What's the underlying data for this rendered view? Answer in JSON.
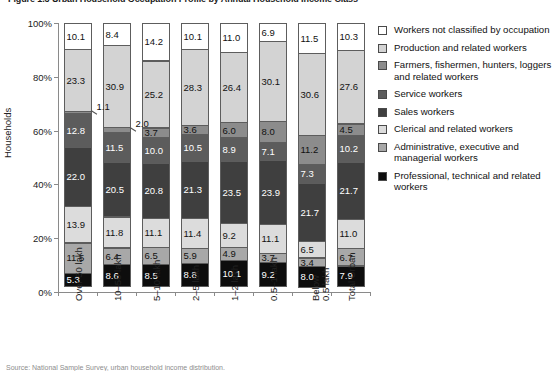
{
  "figure": {
    "title": "Figure 1.3 Urban Household Occupation Profile by Annual Household Income Class",
    "source_note": "Source: National Sample Survey, urban household income distribution."
  },
  "axes": {
    "y_title": "Households",
    "y_ticks": [
      "0%",
      "20%",
      "40%",
      "60%",
      "80%",
      "100%"
    ],
    "y_tick_values": [
      0,
      20,
      40,
      60,
      80,
      100
    ]
  },
  "colors": {
    "workers_not_classified": "#ffffff",
    "production_and_related": "#d3d3d3",
    "farmers_fishermen": "#8c8c8c",
    "service_workers": "#5c5c5c",
    "sales_workers": "#3f3f3f",
    "clerical_and_related": "#dcdcdc",
    "administrative_executive": "#a8a8a8",
    "professional_technical": "#0d0d0d",
    "axis": "#8a8a8a",
    "outline": "#5d5d5d"
  },
  "legend": {
    "items": [
      {
        "label": "Workers not classified by occupation",
        "color": "#ffffff",
        "key": "workers_not_classified"
      },
      {
        "label": "Production and related workers",
        "color": "#d3d3d3",
        "key": "production_and_related"
      },
      {
        "label": "Farmers, fishermen, hunters, loggers and related workers",
        "color": "#8c8c8c",
        "key": "farmers_fishermen"
      },
      {
        "label": "Service workers",
        "color": "#5c5c5c",
        "key": "service_workers"
      },
      {
        "label": "Sales workers",
        "color": "#3f3f3f",
        "key": "sales_workers"
      },
      {
        "label": "Clerical and related workers",
        "color": "#dcdcdc",
        "key": "clerical_and_related"
      },
      {
        "label": "Administrative, executive and managerial workers",
        "color": "#a8a8a8",
        "key": "administrative_executive"
      },
      {
        "label": "Professional, technical and related workers",
        "color": "#0d0d0d",
        "key": "professional_technical"
      }
    ]
  },
  "chart_data": {
    "type": "bar",
    "subtype": "stacked-percentage",
    "title": "Figure 1.3 Urban Household Occupation Profile by Annual Household Income Class",
    "xlabel": "",
    "ylabel": "Households",
    "ylim": [
      0,
      100
    ],
    "grid": false,
    "legend_position": "right",
    "categories": [
      "Over 50 lakh",
      "10–50 lakh",
      "5–10 lakh",
      "2–5 lakh",
      "1–2 lakh",
      "0.5–1 lakh",
      "Below 0.5 lakh",
      "Total Urban"
    ],
    "category_lines": [
      [
        "Over 50 lakh"
      ],
      [
        "10–50 lakh"
      ],
      [
        "5–10 lakh"
      ],
      [
        "2–5 lakh"
      ],
      [
        "1–2 lakh"
      ],
      [
        "0.5–1 lakh"
      ],
      [
        "Below",
        "0.5 lakh"
      ],
      [
        "Total Urban"
      ]
    ],
    "series": [
      {
        "name": "Professional, technical and related workers",
        "color": "#0d0d0d",
        "values": [
          5.3,
          8.6,
          8.5,
          8.8,
          10.1,
          9.2,
          8.0,
          7.9
        ]
      },
      {
        "name": "Administrative, executive and managerial workers",
        "color": "#a8a8a8",
        "values": [
          11.5,
          6.4,
          6.5,
          5.9,
          4.9,
          3.7,
          3.4,
          6.7
        ]
      },
      {
        "name": "Clerical and related workers",
        "color": "#dcdcdc",
        "values": [
          13.9,
          11.8,
          11.1,
          11.4,
          9.2,
          11.1,
          6.5,
          11.0
        ]
      },
      {
        "name": "Sales workers",
        "color": "#3f3f3f",
        "values": [
          22.0,
          20.5,
          20.8,
          21.3,
          23.5,
          23.9,
          21.7,
          21.7
        ]
      },
      {
        "name": "Service workers",
        "color": "#5c5c5c",
        "values": [
          12.8,
          11.5,
          10.0,
          10.5,
          8.9,
          7.1,
          7.3,
          10.2
        ]
      },
      {
        "name": "Farmers, fishermen, hunters, loggers and related workers",
        "color": "#8c8c8c",
        "values": [
          1.1,
          2.0,
          3.7,
          3.6,
          6.0,
          8.0,
          11.2,
          4.5
        ]
      },
      {
        "name": "Production and related workers",
        "color": "#d3d3d3",
        "values": [
          23.3,
          30.9,
          25.2,
          28.3,
          26.4,
          30.1,
          30.6,
          27.6
        ]
      },
      {
        "name": "Workers not classified by occupation",
        "color": "#ffffff",
        "values": [
          10.1,
          8.4,
          14.2,
          10.1,
          11.0,
          6.9,
          11.5,
          10.3
        ]
      }
    ],
    "bars": [
      {
        "category": "Over 50 lakh",
        "segments": [
          {
            "key": "workers_not_classified",
            "value": 10.1,
            "label": "10.1"
          },
          {
            "key": "production_and_related",
            "value": 23.3,
            "label": "23.3"
          },
          {
            "key": "farmers_fishermen",
            "value": 1.1,
            "label": "1.1",
            "callout": true
          },
          {
            "key": "service_workers",
            "value": 12.8,
            "label": "12.8"
          },
          {
            "key": "sales_workers",
            "value": 22.0,
            "label": "22.0"
          },
          {
            "key": "clerical_and_related",
            "value": 13.9,
            "label": "13.9"
          },
          {
            "key": "administrative_executive",
            "value": 11.5,
            "label": "11.5"
          },
          {
            "key": "professional_technical",
            "value": 5.3,
            "label": "5.3"
          }
        ]
      },
      {
        "category": "10–50 lakh",
        "segments": [
          {
            "key": "workers_not_classified",
            "value": 8.4,
            "label": "8.4"
          },
          {
            "key": "production_and_related",
            "value": 30.9,
            "label": "30.9"
          },
          {
            "key": "farmers_fishermen",
            "value": 2.0,
            "label": "2.0",
            "callout": true
          },
          {
            "key": "service_workers",
            "value": 11.5,
            "label": "11.5"
          },
          {
            "key": "sales_workers",
            "value": 20.5,
            "label": "20.5"
          },
          {
            "key": "clerical_and_related",
            "value": 11.8,
            "label": "11.8"
          },
          {
            "key": "administrative_executive",
            "value": 6.4,
            "label": "6.4"
          },
          {
            "key": "professional_technical",
            "value": 8.6,
            "label": "8.6"
          }
        ]
      },
      {
        "category": "5–10 lakh",
        "segments": [
          {
            "key": "workers_not_classified",
            "value": 14.2,
            "label": "14.2"
          },
          {
            "key": "production_and_related",
            "value": 25.2,
            "label": "25.2"
          },
          {
            "key": "farmers_fishermen",
            "value": 3.7,
            "label": "3.7"
          },
          {
            "key": "service_workers",
            "value": 10.0,
            "label": "10.0"
          },
          {
            "key": "sales_workers",
            "value": 20.8,
            "label": "20.8"
          },
          {
            "key": "clerical_and_related",
            "value": 11.1,
            "label": "11.1"
          },
          {
            "key": "administrative_executive",
            "value": 6.5,
            "label": "6.5"
          },
          {
            "key": "professional_technical",
            "value": 8.5,
            "label": "8.5"
          }
        ]
      },
      {
        "category": "2–5 lakh",
        "segments": [
          {
            "key": "workers_not_classified",
            "value": 10.1,
            "label": "10.1"
          },
          {
            "key": "production_and_related",
            "value": 28.3,
            "label": "28.3"
          },
          {
            "key": "farmers_fishermen",
            "value": 3.6,
            "label": "3.6"
          },
          {
            "key": "service_workers",
            "value": 10.5,
            "label": "10.5"
          },
          {
            "key": "sales_workers",
            "value": 21.3,
            "label": "21.3"
          },
          {
            "key": "clerical_and_related",
            "value": 11.4,
            "label": "11.4"
          },
          {
            "key": "administrative_executive",
            "value": 5.9,
            "label": "5.9"
          },
          {
            "key": "professional_technical",
            "value": 8.8,
            "label": "8.8"
          }
        ]
      },
      {
        "category": "1–2 lakh",
        "segments": [
          {
            "key": "workers_not_classified",
            "value": 11.0,
            "label": "11.0"
          },
          {
            "key": "production_and_related",
            "value": 26.4,
            "label": "26.4"
          },
          {
            "key": "farmers_fishermen",
            "value": 6.0,
            "label": "6.0"
          },
          {
            "key": "service_workers",
            "value": 8.9,
            "label": "8.9"
          },
          {
            "key": "sales_workers",
            "value": 23.5,
            "label": "23.5"
          },
          {
            "key": "clerical_and_related",
            "value": 9.2,
            "label": "9.2"
          },
          {
            "key": "administrative_executive",
            "value": 4.9,
            "label": "4.9"
          },
          {
            "key": "professional_technical",
            "value": 10.1,
            "label": "10.1"
          }
        ]
      },
      {
        "category": "0.5–1 lakh",
        "segments": [
          {
            "key": "workers_not_classified",
            "value": 6.9,
            "label": "6.9"
          },
          {
            "key": "production_and_related",
            "value": 30.1,
            "label": "30.1"
          },
          {
            "key": "farmers_fishermen",
            "value": 8.0,
            "label": "8.0"
          },
          {
            "key": "service_workers",
            "value": 7.1,
            "label": "7.1"
          },
          {
            "key": "sales_workers",
            "value": 23.9,
            "label": "23.9"
          },
          {
            "key": "clerical_and_related",
            "value": 11.1,
            "label": "11.1"
          },
          {
            "key": "administrative_executive",
            "value": 3.7,
            "label": "3.7"
          },
          {
            "key": "professional_technical",
            "value": 9.2,
            "label": "9.2"
          }
        ]
      },
      {
        "category": "Below 0.5 lakh",
        "segments": [
          {
            "key": "workers_not_classified",
            "value": 11.5,
            "label": "11.5"
          },
          {
            "key": "production_and_related",
            "value": 30.6,
            "label": "30.6"
          },
          {
            "key": "farmers_fishermen",
            "value": 11.2,
            "label": "11.2"
          },
          {
            "key": "service_workers",
            "value": 7.3,
            "label": "7.3"
          },
          {
            "key": "sales_workers",
            "value": 21.7,
            "label": "21.7"
          },
          {
            "key": "clerical_and_related",
            "value": 6.5,
            "label": "6.5"
          },
          {
            "key": "administrative_executive",
            "value": 3.4,
            "label": "3.4"
          },
          {
            "key": "professional_technical",
            "value": 8.0,
            "label": "8.0"
          }
        ]
      },
      {
        "category": "Total Urban",
        "segments": [
          {
            "key": "workers_not_classified",
            "value": 10.3,
            "label": "10.3"
          },
          {
            "key": "production_and_related",
            "value": 27.6,
            "label": "27.6"
          },
          {
            "key": "farmers_fishermen",
            "value": 4.5,
            "label": "4.5"
          },
          {
            "key": "service_workers",
            "value": 10.2,
            "label": "10.2"
          },
          {
            "key": "sales_workers",
            "value": 21.7,
            "label": "21.7"
          },
          {
            "key": "clerical_and_related",
            "value": 11.0,
            "label": "11.0"
          },
          {
            "key": "administrative_executive",
            "value": 6.7,
            "label": "6.7"
          },
          {
            "key": "professional_technical",
            "value": 7.9,
            "label": "7.9"
          }
        ]
      }
    ]
  }
}
